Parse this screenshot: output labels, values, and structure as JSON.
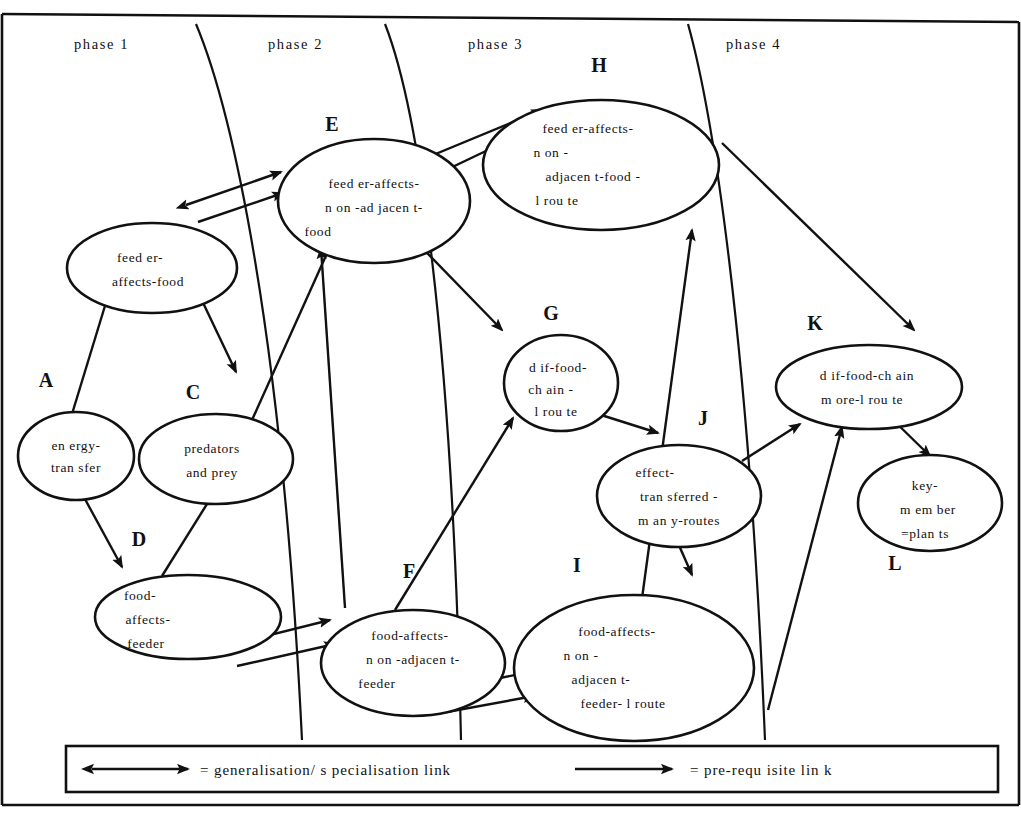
{
  "diagram": {
    "phases": [
      {
        "id": "phase1",
        "label": "phase 1"
      },
      {
        "id": "phase2",
        "label": "phase 2"
      },
      {
        "id": "phase3",
        "label": "phase 3"
      },
      {
        "id": "phase4",
        "label": "phase 4"
      }
    ],
    "nodes": [
      {
        "id": "A",
        "letter": "A",
        "lines": [
          "en ergy-",
          "tran sfer"
        ]
      },
      {
        "id": "B",
        "letter": "",
        "lines": [
          "feed er-",
          "affects-food"
        ]
      },
      {
        "id": "C",
        "letter": "C",
        "lines": [
          "predators",
          "and prey"
        ]
      },
      {
        "id": "D",
        "letter": "D",
        "lines": [
          "food-",
          "affects-",
          "feeder"
        ]
      },
      {
        "id": "E",
        "letter": "E",
        "lines": [
          "feed er-affects-",
          "n on -ad jacen t-",
          "food"
        ]
      },
      {
        "id": "F",
        "letter": "F",
        "lines": [
          "food-affects-",
          "n on -adjacen t-",
          "feeder"
        ]
      },
      {
        "id": "G",
        "letter": "G",
        "lines": [
          "d if-food-",
          "ch ain -",
          "l rou te"
        ]
      },
      {
        "id": "H",
        "letter": "H",
        "lines": [
          "feed er-affects-",
          "n on -",
          "adjacen t-food -",
          "l rou te"
        ]
      },
      {
        "id": "I",
        "letter": "I",
        "lines": [
          "food-affects-",
          "n on -",
          "adjacen t-",
          "feeder- l route"
        ]
      },
      {
        "id": "J",
        "letter": "J",
        "lines": [
          "effect-",
          "tran sferred -",
          "m an y-routes"
        ]
      },
      {
        "id": "K",
        "letter": "K",
        "lines": [
          "d if-food-ch ain",
          "m ore-l rou te"
        ]
      },
      {
        "id": "L",
        "letter": "L",
        "lines": [
          "key-",
          "m em ber",
          "=plan ts"
        ]
      }
    ],
    "legend": {
      "generalisation": "= generalisation/ s pecialisation link",
      "prerequisite": "= pre-requ isite lin k"
    },
    "links": [
      {
        "from": "A",
        "to": "B",
        "kind": "pre-requisite"
      },
      {
        "from": "A",
        "to": "D",
        "kind": "pre-requisite"
      },
      {
        "from": "B",
        "to": "C",
        "kind": "pre-requisite"
      },
      {
        "from": "B",
        "to": "E",
        "kind": "generalisation"
      },
      {
        "from": "D",
        "to": "C",
        "kind": "pre-requisite"
      },
      {
        "from": "D",
        "to": "F",
        "kind": "generalisation"
      },
      {
        "from": "C",
        "to": "E",
        "kind": "pre-requisite"
      },
      {
        "from": "E",
        "to": "H",
        "kind": "generalisation"
      },
      {
        "from": "E",
        "to": "G",
        "kind": "pre-requisite"
      },
      {
        "from": "F",
        "to": "E",
        "kind": "pre-requisite"
      },
      {
        "from": "F",
        "to": "I",
        "kind": "generalisation"
      },
      {
        "from": "G",
        "to": "J",
        "kind": "pre-requisite"
      },
      {
        "from": "I",
        "to": "H",
        "kind": "pre-requisite"
      },
      {
        "from": "J",
        "to": "I",
        "kind": "pre-requisite"
      },
      {
        "from": "J",
        "to": "K",
        "kind": "pre-requisite"
      },
      {
        "from": "I",
        "to": "K",
        "kind": "pre-requisite"
      },
      {
        "from": "H",
        "to": "K",
        "kind": "pre-requisite"
      },
      {
        "from": "K",
        "to": "L",
        "kind": "pre-requisite"
      }
    ],
    "colors": {
      "ink": "#111111",
      "paper": "#ffffff"
    }
  }
}
